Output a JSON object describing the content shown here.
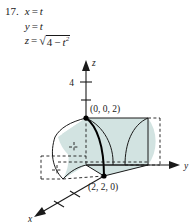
{
  "problem": {
    "number": "17.",
    "equations": [
      {
        "lhs": "x",
        "op": "=",
        "rhs": "t"
      },
      {
        "lhs": "y",
        "op": "=",
        "rhs": "t"
      },
      {
        "lhs": "z",
        "op": "=",
        "radical": true,
        "radicand_a": "4",
        "radicand_op": "−",
        "radicand_var": "t",
        "radicand_exp": "2"
      }
    ]
  },
  "figure": {
    "axes": {
      "z_label": "z",
      "y_label": "y",
      "x_label": "x"
    },
    "ticks": [
      {
        "label": "4"
      },
      {
        "label": ""
      }
    ],
    "points": [
      {
        "label": "(0, 0, 2)"
      },
      {
        "label": "(2, 2, 0)"
      }
    ],
    "colors": {
      "fill": "#d2e3e1",
      "fill_dark": "#c2d8d6",
      "stroke": "#1a1a1a",
      "curve": "#000000",
      "background": "#ffffff"
    }
  }
}
